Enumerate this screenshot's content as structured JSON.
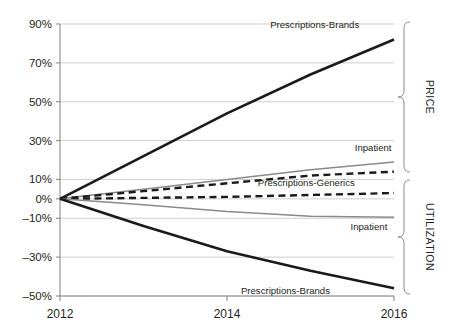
{
  "chart_data": {
    "type": "line",
    "title": "",
    "subtitle": "",
    "xlabel": "",
    "ylabel": "",
    "x": [
      2012,
      2013,
      2014,
      2015,
      2016
    ],
    "xticks": [
      "2012",
      "2014",
      "2016"
    ],
    "xtick_values": [
      2012,
      2014,
      2016
    ],
    "xlim": [
      2012,
      2016
    ],
    "ylim": [
      -50,
      90
    ],
    "yticks": [
      "90%",
      "70%",
      "50%",
      "30%",
      "10%",
      "0%",
      "-10%",
      "-30%",
      "-50%"
    ],
    "ytick_values": [
      90,
      70,
      50,
      30,
      10,
      0,
      -10,
      -30,
      -50
    ],
    "grid": true,
    "legend": "inline-end-labels",
    "units": "percent cumulative change",
    "groups": [
      {
        "name": "PRICE",
        "label": "PRICE",
        "series_indexes": [
          0,
          1,
          2
        ]
      },
      {
        "name": "UTILIZATION",
        "label": "UTILIZATION",
        "series_indexes": [
          3,
          4,
          5
        ]
      }
    ],
    "series": [
      {
        "name": "Prescriptions-Brands",
        "group": "PRICE",
        "label": "Prescriptions-Brands",
        "style": "solid",
        "color": "#1a1a1a",
        "width": 2.6,
        "values": [
          0,
          22,
          44,
          64,
          82
        ]
      },
      {
        "name": "Inpatient",
        "group": "PRICE",
        "label": "Inpatient",
        "style": "solid",
        "color": "#8a8a8a",
        "width": 1.5,
        "values": [
          0,
          5,
          10,
          15,
          19
        ]
      },
      {
        "name": "Prescriptions-Generics",
        "group": "PRICE",
        "label": "Prescriptions-Generics",
        "style": "dashed",
        "color": "#1a1a1a",
        "width": 2.4,
        "values": [
          0,
          4,
          8,
          12,
          14
        ]
      },
      {
        "name": "Prescriptions-Generics",
        "group": "UTILIZATION",
        "label": "Prescriptions-Generics",
        "style": "dashed",
        "color": "#1a1a1a",
        "width": 2.4,
        "values": [
          0,
          0.5,
          1,
          2,
          3
        ]
      },
      {
        "name": "Inpatient",
        "group": "UTILIZATION",
        "label": "Inpatient",
        "style": "solid",
        "color": "#8a8a8a",
        "width": 1.5,
        "values": [
          0,
          -3,
          -6.5,
          -9,
          -9.5
        ]
      },
      {
        "name": "Prescriptions-Brands",
        "group": "UTILIZATION",
        "label": "Prescriptions-Brands",
        "style": "solid",
        "color": "#1a1a1a",
        "width": 2.6,
        "values": [
          0,
          -14,
          -27,
          -37,
          -46
        ]
      }
    ],
    "series_labels": [
      {
        "text": "Prescriptions-Brands",
        "x": 2015.05,
        "y": 88,
        "anchor": "middle"
      },
      {
        "text": "Inpatient",
        "x": 2015.75,
        "y": 24.5,
        "anchor": "middle"
      },
      {
        "text": "Prescriptions-Generics",
        "x": 2014.95,
        "y": 6.5,
        "anchor": "middle"
      },
      {
        "text": "Inpatient",
        "x": 2015.7,
        "y": -16,
        "anchor": "middle"
      },
      {
        "text": "Prescriptions-Brands",
        "x": 2014.7,
        "y": -49,
        "anchor": "middle"
      }
    ],
    "colors": {
      "line_dark": "#1a1a1a",
      "line_gray": "#8a8a8a",
      "grid": "#c9c9c9",
      "axis": "#8c8c8c",
      "text": "#231f20",
      "background": "#ffffff"
    }
  }
}
